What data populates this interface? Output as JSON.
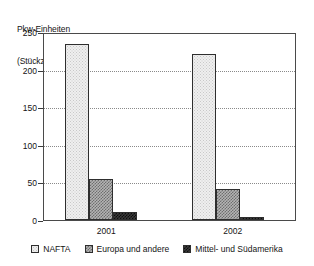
{
  "chart_data": {
    "type": "bar",
    "title": "",
    "ylabel_lines": [
      "Pkw-Einheiten",
      "(Stückzahl in tsd.)"
    ],
    "ylabel": "Pkw-Einheiten (Stückzahl in tsd.)",
    "xlabel": "",
    "categories": [
      "2001",
      "2002"
    ],
    "series": [
      {
        "name": "NAFTA",
        "values": [
          234,
          221
        ],
        "swatch": "light-dotted",
        "color": "#efefef"
      },
      {
        "name": "Europa und andere",
        "values": [
          54,
          41
        ],
        "swatch": "medium-checker",
        "color": "#9a9a9a"
      },
      {
        "name": "Mittel- und Südamerika",
        "values": [
          11,
          4
        ],
        "swatch": "dark-checker",
        "color": "#2b2b2b"
      }
    ],
    "yticks": [
      0,
      50,
      100,
      150,
      200,
      250
    ],
    "ytick_labels": [
      "0",
      "50",
      "100",
      "150",
      "200",
      "250"
    ],
    "ylim": [
      0,
      250
    ],
    "grid": true,
    "grid_style": "dotted-horizontal",
    "legend_position": "bottom-center",
    "plot_border": true,
    "background": "#ffffff",
    "axis_color": "#4a4a4a"
  },
  "legend": {
    "items": [
      {
        "label": "NAFTA"
      },
      {
        "label": "Europa und andere"
      },
      {
        "label": "Mittel- und Südamerika"
      }
    ]
  }
}
